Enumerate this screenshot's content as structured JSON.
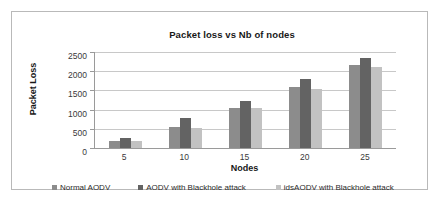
{
  "figure": {
    "border_color": "#b9b9b9",
    "background": "#ffffff"
  },
  "chart_data": {
    "type": "bar",
    "title": "Packet loss vs Nb of nodes",
    "xlabel": "Nodes",
    "ylabel": "Packet Loss",
    "categories": [
      "5",
      "10",
      "15",
      "20",
      "25"
    ],
    "ylim": [
      0,
      2500
    ],
    "yticks": [
      "0",
      "500",
      "1000",
      "1500",
      "2000",
      "2500"
    ],
    "ytick_values": [
      0,
      500,
      1000,
      1500,
      2000,
      2500
    ],
    "grid": true,
    "legend_position": "bottom",
    "series": [
      {
        "name": "Normal AODV",
        "color": "#8c8c8c",
        "values": [
          170,
          560,
          1050,
          1600,
          2150
        ]
      },
      {
        "name": "AODV with Blackhole attack",
        "color": "#636363",
        "values": [
          260,
          780,
          1220,
          1800,
          2350
        ]
      },
      {
        "name": "idsAODV with Blackhole attack",
        "color": "#c2c2c2",
        "values": [
          170,
          520,
          1030,
          1540,
          2120
        ]
      }
    ]
  }
}
